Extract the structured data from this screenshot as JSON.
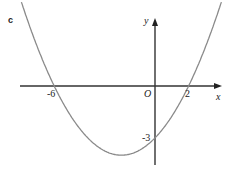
{
  "part_label": "c",
  "axes": {
    "x_label": "x",
    "y_label": "y",
    "origin_label": "O"
  },
  "ticks": {
    "x_neg": "-6",
    "x_pos": "2",
    "y_int": "-3"
  },
  "colors": {
    "axis": "#333333",
    "curve": "#8a8a8a"
  },
  "chart_data": {
    "type": "line",
    "title": "",
    "function": "y = (x+6)(x-2)/4",
    "x_intercepts": [
      -6,
      2
    ],
    "y_intercept": -3,
    "vertex": [
      -2,
      -4
    ],
    "xlabel": "x",
    "ylabel": "y",
    "grid": false
  }
}
